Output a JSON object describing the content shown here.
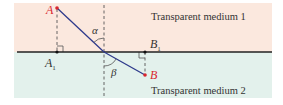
{
  "diagram": {
    "type": "refraction-diagram",
    "colors": {
      "medium1_bg": "#fbe8de",
      "medium2_bg": "#e3f1ec",
      "interface": "#222222",
      "ray": "#2e3a8c",
      "point_red": "#d9262e",
      "point_black": "#111111",
      "dashed": "#555555",
      "text": "#333333"
    },
    "media": [
      {
        "id": "medium1",
        "label": "Transparent medium 1"
      },
      {
        "id": "medium2",
        "label": "Transparent medium 2"
      }
    ],
    "points": {
      "A": {
        "label": "A"
      },
      "A1": {
        "label": "A",
        "subscript": "1"
      },
      "B": {
        "label": "B"
      },
      "B1": {
        "label": "B",
        "subscript": "1"
      }
    },
    "angles": {
      "incidence": {
        "label": "α"
      },
      "refraction": {
        "label": "β"
      }
    }
  }
}
